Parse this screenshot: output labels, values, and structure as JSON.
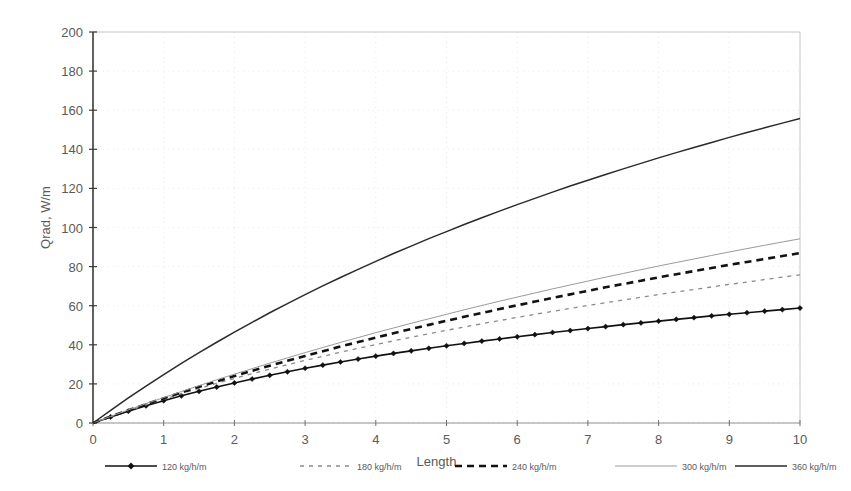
{
  "chart_data": {
    "type": "line",
    "title": "",
    "xlabel": "Length",
    "ylabel": "Qrad, W/m",
    "xlim": [
      0,
      10
    ],
    "ylim": [
      0,
      200
    ],
    "xticks": [
      "0",
      "1",
      "2",
      "3",
      "4",
      "5",
      "6",
      "7",
      "8",
      "9",
      "10"
    ],
    "yticks": [
      "0",
      "20",
      "40",
      "60",
      "80",
      "100",
      "120",
      "140",
      "160",
      "180",
      "200"
    ],
    "grid": "faint-dotted-both",
    "legend_position": "bottom-outside",
    "x": [
      0,
      0.25,
      0.5,
      0.75,
      1,
      1.25,
      1.5,
      1.75,
      2,
      2.25,
      2.5,
      2.75,
      3,
      3.25,
      3.5,
      3.75,
      4,
      4.25,
      4.5,
      4.75,
      5,
      5.25,
      5.5,
      5.75,
      6,
      6.25,
      6.5,
      6.75,
      7,
      7.25,
      7.5,
      7.75,
      8,
      8.25,
      8.5,
      8.75,
      9,
      9.25,
      9.5,
      9.75,
      10
    ],
    "series": [
      {
        "name": "120 kg/h/m",
        "style": "solid-with-diamond-markers",
        "color": "#111111",
        "width": 1.6,
        "markers": true,
        "values": [
          0,
          3.1,
          6.0,
          8.8,
          11.4,
          13.9,
          16.2,
          18.4,
          20.5,
          22.5,
          24.4,
          26.2,
          28.0,
          29.6,
          31.2,
          32.7,
          34.2,
          35.6,
          36.9,
          38.2,
          39.5,
          40.7,
          41.9,
          43.0,
          44.1,
          45.2,
          46.3,
          47.3,
          48.3,
          49.3,
          50.3,
          51.2,
          52.1,
          53.0,
          53.9,
          54.8,
          55.6,
          56.4,
          57.2,
          58.0,
          58.8
        ]
      },
      {
        "name": "180 kg/h/m",
        "style": "fine-dashed",
        "color": "#8a8a8a",
        "width": 1.3,
        "markers": false,
        "values": [
          0,
          3.2,
          6.3,
          9.3,
          12.2,
          15.0,
          17.7,
          20.3,
          22.8,
          25.2,
          27.5,
          29.8,
          32.0,
          34.1,
          36.2,
          38.2,
          40.1,
          42.0,
          43.9,
          45.7,
          47.4,
          49.1,
          50.8,
          52.4,
          54.0,
          55.6,
          57.1,
          58.6,
          60.1,
          61.5,
          62.9,
          64.3,
          65.7,
          67.0,
          68.3,
          69.6,
          70.9,
          72.1,
          73.4,
          74.6,
          75.8
        ]
      },
      {
        "name": "240 kg/h/m",
        "style": "bold-dashed",
        "color": "#121212",
        "width": 2.6,
        "markers": false,
        "values": [
          0,
          3.3,
          6.5,
          9.6,
          12.6,
          15.6,
          18.5,
          21.3,
          24.0,
          26.7,
          29.3,
          31.8,
          34.3,
          36.7,
          39.1,
          41.4,
          43.7,
          45.9,
          48.1,
          50.2,
          52.3,
          54.3,
          56.3,
          58.3,
          60.2,
          62.1,
          64.0,
          65.8,
          67.6,
          69.4,
          71.1,
          72.8,
          74.5,
          76.1,
          77.7,
          79.3,
          80.9,
          82.4,
          83.9,
          85.4,
          86.9
        ]
      },
      {
        "name": "300 kg/h/m",
        "style": "thin-solid-light",
        "color": "#9a9a9a",
        "width": 1.0,
        "markers": false,
        "values": [
          0,
          3.4,
          6.7,
          9.9,
          13.0,
          16.1,
          19.1,
          22.1,
          25.0,
          27.8,
          30.6,
          33.3,
          36.0,
          38.6,
          41.2,
          43.7,
          46.2,
          48.6,
          51.0,
          53.3,
          55.6,
          57.9,
          60.1,
          62.3,
          64.4,
          66.5,
          68.6,
          70.6,
          72.6,
          74.6,
          76.5,
          78.4,
          80.3,
          82.1,
          83.9,
          85.7,
          87.5,
          89.2,
          90.9,
          92.6,
          94.2
        ]
      },
      {
        "name": "360 kg/h/m",
        "style": "solid-medium",
        "color": "#2a2a2a",
        "width": 1.5,
        "markers": false,
        "values": [
          0,
          6.5,
          12.8,
          18.9,
          24.8,
          30.5,
          36.0,
          41.3,
          46.5,
          51.5,
          56.4,
          61.1,
          65.7,
          70.1,
          74.4,
          78.6,
          82.7,
          86.7,
          90.5,
          94.3,
          97.9,
          101.5,
          105.0,
          108.4,
          111.7,
          114.9,
          118.1,
          121.2,
          124.2,
          127.1,
          130.0,
          132.8,
          135.6,
          138.3,
          140.9,
          143.5,
          146.1,
          148.6,
          151.0,
          153.4,
          155.8
        ]
      }
    ]
  },
  "legend": {
    "items": [
      {
        "label": "120 kg/h/m"
      },
      {
        "label": "180 kg/h/m"
      },
      {
        "label": "240 kg/h/m"
      },
      {
        "label": "300 kg/h/m"
      },
      {
        "label": "360 kg/h/m"
      }
    ]
  },
  "axes": {
    "x_title": "Length",
    "y_title": "Qrad, W/m"
  }
}
